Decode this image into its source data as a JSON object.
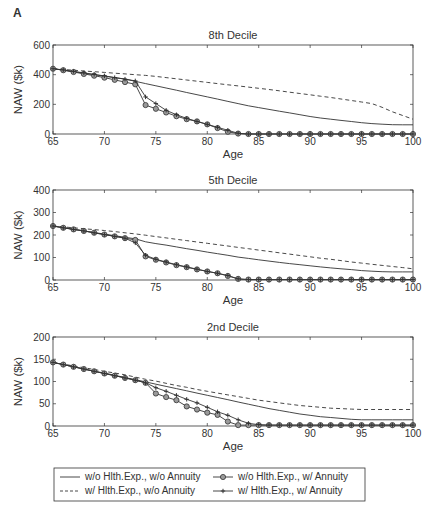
{
  "figure": {
    "panel_label": "A"
  },
  "chart_data": [
    {
      "type": "line",
      "title": "8th Decile",
      "xlabel": "Age",
      "ylabel": "NAW ($k)",
      "xlim": [
        65,
        100
      ],
      "ylim": [
        0,
        600
      ],
      "xticks": [
        65,
        70,
        75,
        80,
        85,
        90,
        95,
        100
      ],
      "yticks": [
        0,
        200,
        400,
        600
      ],
      "grid": false,
      "x": [
        65,
        66,
        67,
        68,
        69,
        70,
        71,
        72,
        73,
        74,
        75,
        76,
        77,
        78,
        79,
        80,
        81,
        82,
        83,
        84,
        85,
        86,
        87,
        88,
        89,
        90,
        91,
        92,
        93,
        94,
        95,
        96,
        97,
        98,
        99,
        100
      ],
      "series": [
        {
          "name": "w/o Hlth.Exp., w/o Annuity",
          "style": "solid",
          "values": [
            440,
            430,
            420,
            410,
            400,
            390,
            380,
            370,
            355,
            340,
            325,
            310,
            295,
            280,
            265,
            250,
            235,
            220,
            205,
            190,
            178,
            166,
            154,
            142,
            130,
            118,
            108,
            100,
            92,
            84,
            76,
            70,
            66,
            63,
            62,
            62
          ]
        },
        {
          "name": "w/ Hlth.Exp., w/o Annuity",
          "style": "dashed",
          "values": [
            440,
            435,
            430,
            425,
            420,
            415,
            410,
            405,
            400,
            395,
            388,
            380,
            372,
            364,
            356,
            348,
            340,
            332,
            324,
            316,
            308,
            300,
            291,
            282,
            273,
            264,
            255,
            246,
            236,
            226,
            216,
            205,
            180,
            150,
            125,
            100
          ]
        },
        {
          "name": "w/o Hlth.Exp., w/ Annuity",
          "style": "circle",
          "values": [
            440,
            430,
            418,
            405,
            393,
            380,
            365,
            350,
            335,
            195,
            170,
            145,
            120,
            100,
            85,
            65,
            40,
            15,
            3,
            0,
            0,
            0,
            0,
            0,
            0,
            0,
            0,
            0,
            0,
            0,
            0,
            0,
            0,
            0,
            0,
            0
          ]
        },
        {
          "name": "w/ Hlth.Exp., w/ Annuity",
          "style": "plus",
          "values": [
            440,
            432,
            422,
            412,
            402,
            392,
            380,
            370,
            358,
            250,
            205,
            160,
            130,
            105,
            85,
            65,
            45,
            25,
            5,
            0,
            0,
            0,
            0,
            0,
            0,
            0,
            0,
            0,
            0,
            0,
            0,
            0,
            0,
            0,
            0,
            0
          ]
        }
      ]
    },
    {
      "type": "line",
      "title": "5th Decile",
      "xlabel": "Age",
      "ylabel": "NAW ($k)",
      "xlim": [
        65,
        100
      ],
      "ylim": [
        0,
        400
      ],
      "xticks": [
        65,
        70,
        75,
        80,
        85,
        90,
        95,
        100
      ],
      "yticks": [
        0,
        100,
        200,
        300,
        400
      ],
      "grid": false,
      "x": [
        65,
        66,
        67,
        68,
        69,
        70,
        71,
        72,
        73,
        74,
        75,
        76,
        77,
        78,
        79,
        80,
        81,
        82,
        83,
        84,
        85,
        86,
        87,
        88,
        89,
        90,
        91,
        92,
        93,
        94,
        95,
        96,
        97,
        98,
        99,
        100
      ],
      "series": [
        {
          "name": "w/o Hlth.Exp., w/o Annuity",
          "style": "solid",
          "values": [
            240,
            233,
            225,
            218,
            211,
            204,
            197,
            190,
            183,
            170,
            162,
            155,
            147,
            139,
            132,
            124,
            117,
            110,
            102,
            96,
            90,
            84,
            78,
            73,
            68,
            63,
            58,
            54,
            50,
            46,
            42,
            39,
            37,
            36,
            36,
            36
          ]
        },
        {
          "name": "w/ Hlth.Exp., w/o Annuity",
          "style": "dashed",
          "values": [
            240,
            236,
            232,
            228,
            224,
            220,
            215,
            210,
            205,
            199,
            193,
            187,
            181,
            175,
            169,
            163,
            157,
            151,
            145,
            139,
            133,
            127,
            121,
            115,
            109,
            103,
            97,
            92,
            86,
            80,
            75,
            70,
            65,
            60,
            55,
            50
          ]
        },
        {
          "name": "w/o Hlth.Exp., w/ Annuity",
          "style": "circle",
          "values": [
            240,
            232,
            225,
            218,
            210,
            202,
            194,
            186,
            178,
            105,
            90,
            78,
            66,
            57,
            47,
            38,
            30,
            18,
            5,
            2,
            2,
            2,
            2,
            2,
            2,
            2,
            2,
            2,
            2,
            2,
            2,
            2,
            2,
            2,
            2,
            2
          ]
        },
        {
          "name": "w/ Hlth.Exp., w/ Annuity",
          "style": "plus",
          "values": [
            240,
            232,
            225,
            218,
            210,
            202,
            194,
            186,
            165,
            110,
            92,
            80,
            68,
            58,
            48,
            38,
            30,
            20,
            5,
            2,
            2,
            2,
            2,
            2,
            2,
            2,
            2,
            2,
            2,
            2,
            2,
            2,
            2,
            2,
            2,
            2
          ]
        }
      ]
    },
    {
      "type": "line",
      "title": "2nd Decile",
      "xlabel": "Age",
      "ylabel": "NAW ($k)",
      "xlim": [
        65,
        100
      ],
      "ylim": [
        0,
        200
      ],
      "xticks": [
        65,
        70,
        75,
        80,
        85,
        90,
        95,
        100
      ],
      "yticks": [
        0,
        50,
        100,
        150,
        200
      ],
      "grid": false,
      "x": [
        65,
        66,
        67,
        68,
        69,
        70,
        71,
        72,
        73,
        74,
        75,
        76,
        77,
        78,
        79,
        80,
        81,
        82,
        83,
        84,
        85,
        86,
        87,
        88,
        89,
        90,
        91,
        92,
        93,
        94,
        95,
        96,
        97,
        98,
        99,
        100
      ],
      "series": [
        {
          "name": "w/o Hlth.Exp., w/o Annuity",
          "style": "solid",
          "values": [
            143,
            138,
            133,
            128,
            123,
            119,
            114,
            109,
            104,
            99,
            94,
            89,
            84,
            79,
            74,
            69,
            64,
            59,
            54,
            49,
            44,
            39,
            35,
            31,
            27,
            24,
            21,
            19,
            17,
            15,
            14,
            14,
            14,
            14,
            14,
            14
          ]
        },
        {
          "name": "w/ Hlth.Exp., w/o Annuity",
          "style": "dashed",
          "values": [
            143,
            139,
            135,
            131,
            127,
            123,
            119,
            115,
            110,
            105,
            101,
            96,
            91,
            87,
            82,
            78,
            74,
            70,
            66,
            62,
            58,
            55,
            52,
            49,
            46,
            44,
            42,
            40,
            39,
            38,
            37,
            37,
            37,
            37,
            37,
            37
          ]
        },
        {
          "name": "w/o Hlth.Exp., w/ Annuity",
          "style": "circle",
          "values": [
            143,
            138,
            133,
            128,
            123,
            118,
            113,
            108,
            103,
            97,
            73,
            65,
            58,
            44,
            37,
            30,
            25,
            10,
            2,
            2,
            2,
            2,
            2,
            2,
            2,
            2,
            2,
            2,
            2,
            2,
            2,
            2,
            2,
            2,
            2,
            2
          ]
        },
        {
          "name": "w/ Hlth.Exp., w/ Annuity",
          "style": "plus",
          "values": [
            143,
            138,
            133,
            128,
            123,
            118,
            113,
            108,
            103,
            97,
            86,
            78,
            69,
            60,
            52,
            42,
            32,
            24,
            14,
            6,
            3,
            2,
            2,
            2,
            2,
            2,
            2,
            2,
            2,
            2,
            2,
            2,
            2,
            2,
            2,
            2
          ]
        }
      ]
    }
  ],
  "legend": {
    "items": [
      {
        "label": "w/o Hlth.Exp., w/o Annuity",
        "style": "solid"
      },
      {
        "label": "w/o Hlth.Exp., w/ Annuity",
        "style": "circle"
      },
      {
        "label": "w/ Hlth.Exp., w/o Annuity",
        "style": "dashed"
      },
      {
        "label": "w/ Hlth.Exp., w/ Annuity",
        "style": "plus"
      }
    ],
    "position": "bottom"
  },
  "colors": {
    "line": "#333333",
    "marker_fill": "#9a9a9a"
  }
}
